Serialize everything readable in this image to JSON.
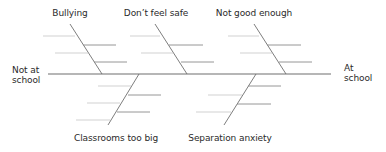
{
  "diagram": {
    "type": "fishbone",
    "left_end": {
      "line1": "Not at",
      "line2": "school"
    },
    "right_end": {
      "line1": "At",
      "line2": "school"
    },
    "colors": {
      "spine": "#6e6e6e",
      "bone": "#6e6e6e",
      "sub_dark": "#8a8a8a",
      "sub_light": "#c8c8c8",
      "text": "#2a2a2a"
    },
    "top_causes": [
      {
        "label": "Bullying"
      },
      {
        "label": "Don’t feel safe"
      },
      {
        "label": "Not good enough"
      }
    ],
    "bottom_causes": [
      {
        "label": "Classrooms too big"
      },
      {
        "label": "Separation anxiety"
      }
    ]
  }
}
